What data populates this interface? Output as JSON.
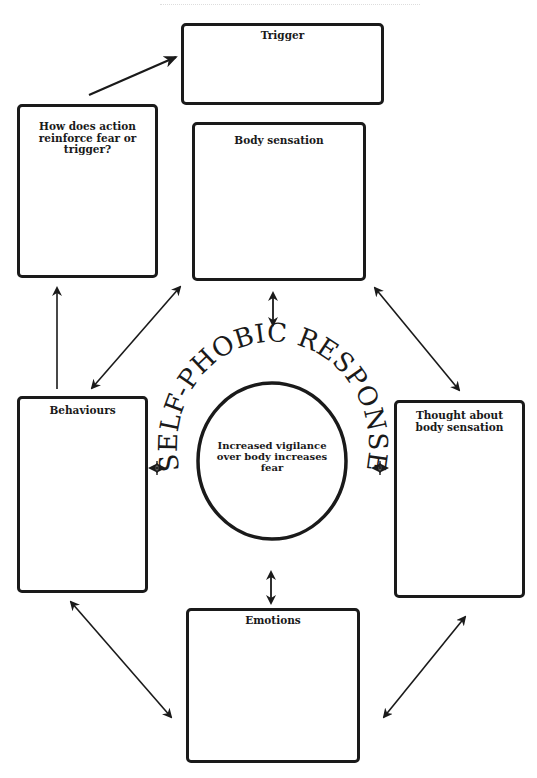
{
  "diagram": {
    "title": "SELF-PHOBIC RESPONSE",
    "center": {
      "text": "Increased vigilance over body increases fear"
    },
    "boxes": {
      "trigger": {
        "label": "Trigger"
      },
      "reinforce": {
        "label": "How does action reinforce fear or trigger?"
      },
      "body_sensation": {
        "label": "Body sensation"
      },
      "behaviours": {
        "label": "Behaviours"
      },
      "thought": {
        "label": "Thought about body sensation"
      },
      "emotions": {
        "label": "Emotions"
      }
    },
    "connections": [
      {
        "from": "reinforce",
        "to": "trigger",
        "type": "one-way"
      },
      {
        "from": "behaviours",
        "to": "reinforce",
        "type": "one-way"
      },
      {
        "from": "body_sensation",
        "to": "behaviours",
        "type": "two-way"
      },
      {
        "from": "body_sensation",
        "to": "thought",
        "type": "two-way"
      },
      {
        "from": "body_sensation",
        "to": "center",
        "type": "two-way"
      },
      {
        "from": "behaviours",
        "to": "center",
        "type": "two-way"
      },
      {
        "from": "thought",
        "to": "center",
        "type": "two-way"
      },
      {
        "from": "emotions",
        "to": "center",
        "type": "two-way"
      },
      {
        "from": "behaviours",
        "to": "emotions",
        "type": "two-way"
      },
      {
        "from": "thought",
        "to": "emotions",
        "type": "two-way"
      }
    ],
    "colors": {
      "ink": "#1a1a1a",
      "background": "#ffffff"
    }
  }
}
